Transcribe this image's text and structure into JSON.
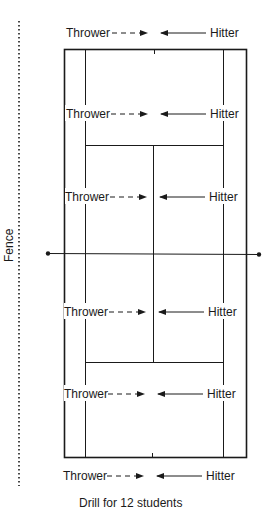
{
  "diagram": {
    "caption": "Drill for 12 students",
    "fence_label": "Fence",
    "colors": {
      "line": "#1a1a1a",
      "background": "#ffffff"
    },
    "rows": [
      {
        "thrower": "Thrower",
        "hitter": "Hitter",
        "position": "outside-top-baseline"
      },
      {
        "thrower": "Thrower",
        "hitter": "Hitter",
        "position": "top-backcourt"
      },
      {
        "thrower": "Thrower",
        "hitter": "Hitter",
        "position": "top-service-box"
      },
      {
        "thrower": "Thrower",
        "hitter": "Hitter",
        "position": "bottom-service-box"
      },
      {
        "thrower": "Thrower",
        "hitter": "Hitter",
        "position": "bottom-backcourt"
      },
      {
        "thrower": "Thrower",
        "hitter": "Hitter",
        "position": "outside-bottom-baseline"
      }
    ],
    "legend": {
      "thrower_arrow": "dashed-arrow-right",
      "hitter_arrow": "solid-arrow-left"
    }
  }
}
